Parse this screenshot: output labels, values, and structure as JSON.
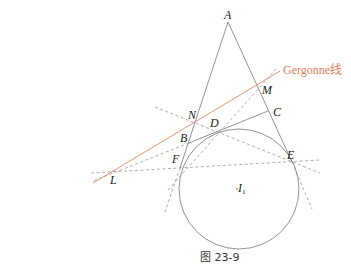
{
  "diagram": {
    "caption": "图 23-9",
    "gergonne_label": "Gergonne线",
    "points": {
      "A": "A",
      "M": "M",
      "C": "C",
      "N": "N",
      "D": "D",
      "B": "B",
      "F": "F",
      "E": "E",
      "L": "L",
      "I": "I",
      "I_sub": "1"
    },
    "colors": {
      "solid_line": "#777777",
      "dashed_line": "#888888",
      "gergonne_line": "#e08a64",
      "circle": "#777777"
    }
  }
}
